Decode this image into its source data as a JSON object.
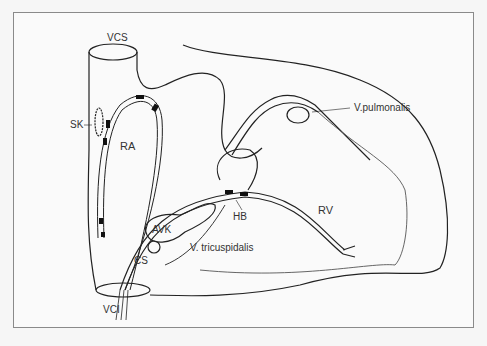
{
  "diagram": {
    "labels": {
      "vcs": "VCS",
      "sk": "SK",
      "ra": "RA",
      "v_pulmonalis": "V.pulmonalis",
      "rv": "RV",
      "hb": "HB",
      "avk": "AVK",
      "v_tricuspidalis": "V. tricuspidalis",
      "cs": "CS",
      "vci": "VCI"
    },
    "colors": {
      "line": "#222222",
      "background": "#fafafa",
      "frame": "#8a8a8a"
    }
  }
}
